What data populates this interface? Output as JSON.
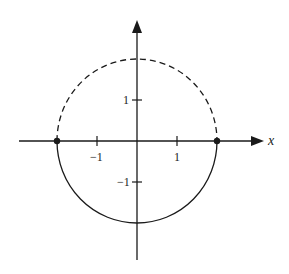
{
  "diagram": {
    "x_axis_label": "x",
    "tick_labels": {
      "x_neg1": "−1",
      "x_pos1": "1",
      "y_pos1": "1",
      "y_neg1": "−1"
    },
    "circle": {
      "center": [
        0,
        0
      ],
      "radius": 2,
      "upper_half": "dashed",
      "lower_half": "solid"
    },
    "points": [
      {
        "name": "left-endpoint",
        "x": -2,
        "y": 0
      },
      {
        "name": "right-endpoint",
        "x": 2,
        "y": 0
      }
    ],
    "stroke_color": "#1a1a1a"
  }
}
